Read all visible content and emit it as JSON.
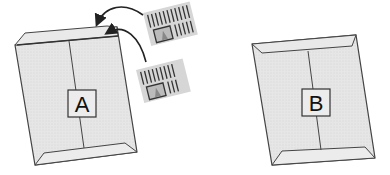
{
  "diagram": {
    "envelopes": [
      {
        "id": "A",
        "label": "A",
        "fill": "#e4e4e4",
        "stroke": "#444444"
      },
      {
        "id": "B",
        "label": "B",
        "fill": "#e4e4e4",
        "stroke": "#444444"
      }
    ],
    "documents": [
      {
        "id": "doc-1",
        "fill": "#d8d8d8"
      },
      {
        "id": "doc-2",
        "fill": "#d8d8d8"
      }
    ],
    "arrows": [
      {
        "from": "doc-1",
        "to": "A"
      },
      {
        "from": "doc-2",
        "to": "A"
      }
    ]
  }
}
